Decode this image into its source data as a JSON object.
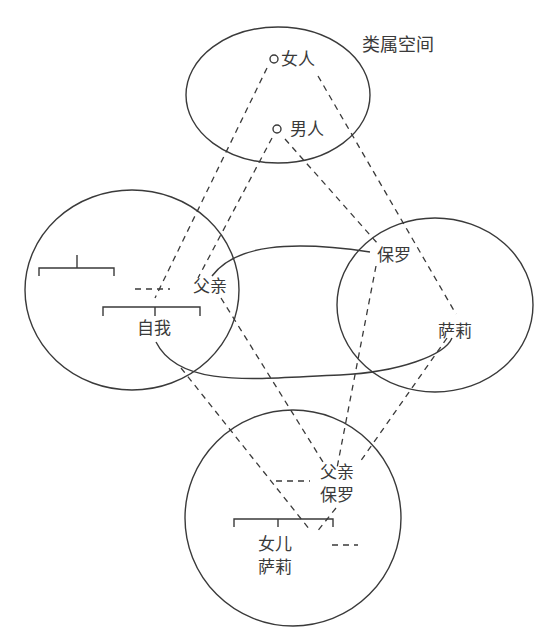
{
  "diagram": {
    "generic_space": {
      "title": "类属空间",
      "nodes": [
        "女人",
        "男人"
      ]
    },
    "input_space_1": {
      "nodes": [
        "父亲",
        "自我"
      ]
    },
    "input_space_2": {
      "nodes": [
        "保罗",
        "萨莉"
      ]
    },
    "blended_space": {
      "nodes": [
        {
          "line1": "父亲",
          "line2": "保罗"
        },
        {
          "line1": "女儿",
          "line2": "萨莉"
        }
      ]
    },
    "colors": {
      "stroke": "#3a3a3a",
      "background": "#ffffff"
    }
  }
}
